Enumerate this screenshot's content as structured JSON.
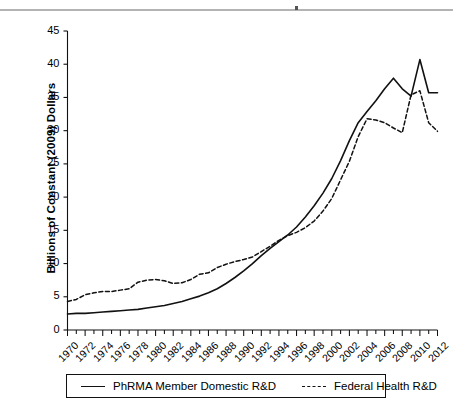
{
  "figure": {
    "background": "#ffffff",
    "rule_color": "#b3b3b3"
  },
  "axis": {
    "y_title": "Billions of Constant (2009) Dollars",
    "y_ticks": [
      "0",
      "5",
      "10",
      "15",
      "20",
      "25",
      "30",
      "35",
      "40",
      "45"
    ],
    "x_ticks": [
      "1970",
      "1972",
      "1974",
      "1976",
      "1978",
      "1980",
      "1982",
      "1984",
      "1986",
      "1988",
      "1990",
      "1992",
      "1994",
      "1996",
      "1998",
      "2000",
      "2002",
      "2004",
      "2006",
      "2008",
      "2010",
      "2012"
    ]
  },
  "legend": {
    "entries": [
      {
        "label": "PhRMA Member Domestic R&D",
        "style": "solid",
        "color": "#111111"
      },
      {
        "label": "Federal Health R&D",
        "style": "dashed",
        "color": "#111111"
      }
    ]
  },
  "chart_data": {
    "type": "line",
    "title": "",
    "xlabel": "",
    "ylabel": "Billions of Constant (2009) Dollars",
    "xlim": [
      1970,
      2012
    ],
    "ylim": [
      0,
      45
    ],
    "ytick_step": 5,
    "xtick_step": 2,
    "grid": false,
    "legend_position": "bottom",
    "x": [
      1970,
      1971,
      1972,
      1973,
      1974,
      1975,
      1976,
      1977,
      1978,
      1979,
      1980,
      1981,
      1982,
      1983,
      1984,
      1985,
      1986,
      1987,
      1988,
      1989,
      1990,
      1991,
      1992,
      1993,
      1994,
      1995,
      1996,
      1997,
      1998,
      1999,
      2000,
      2001,
      2002,
      2003,
      2004,
      2005,
      2006,
      2007,
      2008,
      2009,
      2010,
      2011,
      2012
    ],
    "series": [
      {
        "name": "PhRMA Member Domestic R&D",
        "style": "solid",
        "color": "#111111",
        "values": [
          2.4,
          2.5,
          2.5,
          2.6,
          2.7,
          2.8,
          2.9,
          3.0,
          3.1,
          3.3,
          3.5,
          3.7,
          4.0,
          4.3,
          4.7,
          5.1,
          5.6,
          6.2,
          7.0,
          7.9,
          8.9,
          10.0,
          11.2,
          12.3,
          13.3,
          14.3,
          15.5,
          17.0,
          18.7,
          20.6,
          22.8,
          25.5,
          28.5,
          31.2,
          32.9,
          34.5,
          36.3,
          37.9,
          36.3,
          35.2,
          40.7,
          35.7,
          35.7
        ]
      },
      {
        "name": "Federal Health R&D",
        "style": "dashed",
        "color": "#111111",
        "values": [
          4.3,
          4.6,
          5.3,
          5.6,
          5.8,
          5.8,
          6.0,
          6.2,
          7.2,
          7.5,
          7.6,
          7.4,
          7.0,
          7.1,
          7.6,
          8.4,
          8.6,
          9.4,
          9.9,
          10.3,
          10.6,
          11.0,
          11.8,
          12.6,
          13.5,
          14.2,
          14.7,
          15.4,
          16.4,
          17.9,
          19.8,
          22.6,
          25.4,
          29.1,
          31.8,
          31.6,
          31.2,
          30.4,
          29.7,
          35.4,
          36.0,
          31.2,
          29.9
        ]
      }
    ]
  }
}
